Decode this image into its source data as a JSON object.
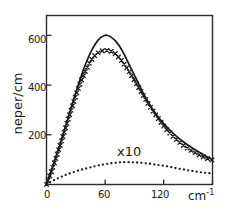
{
  "chart_data": {
    "type": "line",
    "title": "",
    "xlabel": "cm",
    "xlabel_sup": "-1",
    "ylabel": "neper/cm",
    "xlim": [
      0,
      170
    ],
    "ylim": [
      0,
      680
    ],
    "xticks": [
      0,
      60,
      120
    ],
    "xtick_labels": [
      "0",
      "60",
      "120"
    ],
    "yticks": [
      200,
      400,
      600
    ],
    "ytick_labels": [
      "200",
      "400",
      "600"
    ],
    "grid": false,
    "legend": "none",
    "annotations": [
      {
        "text": "x10",
        "x": 80,
        "y": 150
      }
    ],
    "series": [
      {
        "name": "solid-curve",
        "marker": "none",
        "style": "solid",
        "x": [
          0,
          5,
          10,
          15,
          20,
          25,
          30,
          35,
          40,
          45,
          50,
          55,
          60,
          62,
          65,
          70,
          75,
          80,
          85,
          90,
          95,
          100,
          110,
          120,
          130,
          140,
          150,
          160,
          170
        ],
        "y": [
          0,
          55,
          115,
          175,
          240,
          305,
          370,
          430,
          485,
          530,
          565,
          590,
          600,
          600,
          596,
          580,
          555,
          520,
          480,
          440,
          400,
          360,
          295,
          245,
          205,
          172,
          145,
          122,
          100
        ]
      },
      {
        "name": "cross-marker-curve",
        "marker": "x",
        "style": "markers",
        "x": [
          0,
          5,
          10,
          15,
          20,
          25,
          30,
          35,
          40,
          45,
          50,
          55,
          60,
          65,
          70,
          75,
          80,
          85,
          90,
          95,
          100,
          105,
          110,
          115,
          120,
          125,
          130,
          135,
          140,
          145,
          150,
          155,
          160,
          165,
          170
        ],
        "y": [
          0,
          52,
          110,
          170,
          234,
          298,
          358,
          412,
          458,
          496,
          522,
          536,
          540,
          538,
          528,
          508,
          482,
          452,
          420,
          386,
          352,
          320,
          290,
          262,
          236,
          212,
          192,
          174,
          158,
          144,
          132,
          122,
          112,
          104,
          98
        ]
      },
      {
        "name": "dotted-curve-x10",
        "marker": "dot",
        "style": "dotted",
        "x": [
          0,
          5,
          10,
          15,
          20,
          25,
          30,
          35,
          40,
          45,
          50,
          55,
          60,
          65,
          70,
          75,
          80,
          85,
          90,
          95,
          100,
          105,
          110,
          115,
          120,
          125,
          130,
          135,
          140,
          145,
          150,
          155,
          160,
          165,
          170
        ],
        "y": [
          0,
          12,
          22,
          31,
          39,
          46,
          53,
          59,
          64,
          69,
          74,
          78,
          82,
          85,
          87,
          89,
          90,
          90,
          89,
          88,
          86,
          84,
          81,
          78,
          75,
          72,
          68,
          64,
          61,
          57,
          54,
          51,
          48,
          46,
          44
        ]
      }
    ]
  }
}
